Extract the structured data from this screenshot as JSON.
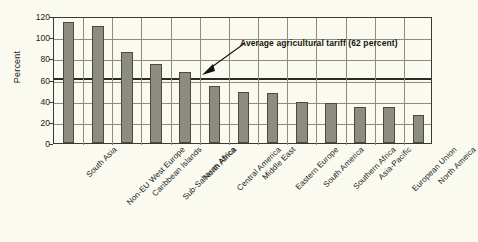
{
  "chart_data": {
    "type": "bar",
    "title": "",
    "subtitle": "",
    "xlabel": "",
    "ylabel": "Percent",
    "ylim": [
      0,
      120
    ],
    "yticks": [
      0,
      20,
      40,
      60,
      80,
      100,
      120
    ],
    "grid": true,
    "legend": null,
    "categories": [
      "South Asia",
      "Non-EU West Europe",
      "Caribbean Islands",
      "Sub-Saharan Africa",
      "North Africa",
      "Central America",
      "Middle East",
      "Eastern Europe",
      "South America",
      "Southern Africa",
      "Asia-Pacific",
      "European Union",
      "North Ameica"
    ],
    "values": [
      114,
      111,
      86,
      75,
      67,
      54,
      48,
      47,
      39,
      38,
      34,
      34,
      26
    ],
    "annotations": [
      {
        "text": "Average agricultural tariff (62 percent)",
        "value": 62,
        "type": "reference-line-with-arrow"
      }
    ],
    "bar_color": "#8c8c81",
    "bar_border_color": "#4a4a42",
    "gridline_color": "#8d8d7e",
    "axis_color": "#3a3a34",
    "average_line_color": "#2b2b26",
    "background_color": "#fbfaf0"
  }
}
